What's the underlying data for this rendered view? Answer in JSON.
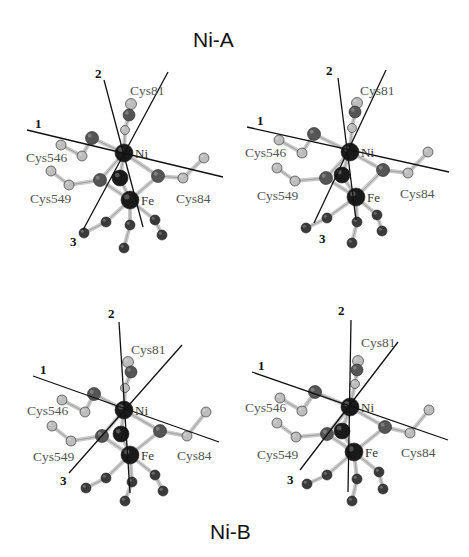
{
  "figure": {
    "title_top": "Ni-A",
    "title_bottom": "Ni-B",
    "labels": {
      "axis1": "1",
      "axis2": "2",
      "axis3": "3",
      "ni": "Ni",
      "fe": "Fe",
      "cys81": "Cys81",
      "cys84": "Cys84",
      "cys546": "Cys546",
      "cys549": "Cys549"
    },
    "panels": [
      {
        "id": "ni-a-left",
        "state": "Ni-A",
        "view": "stereo-left"
      },
      {
        "id": "ni-a-right",
        "state": "Ni-A",
        "view": "stereo-right"
      },
      {
        "id": "ni-b-left",
        "state": "Ni-B",
        "view": "stereo-left"
      },
      {
        "id": "ni-b-right",
        "state": "Ni-B",
        "view": "stereo-right"
      }
    ],
    "colors": {
      "axis_line": "#111111",
      "metal_atom": "#1a1a1a",
      "sulfur_atom": "#555555",
      "carbon_atom": "#bdbdbd",
      "ligand_atom": "#3a3a3a",
      "bond": "#c8c8c8",
      "label_text": "#555555"
    }
  }
}
